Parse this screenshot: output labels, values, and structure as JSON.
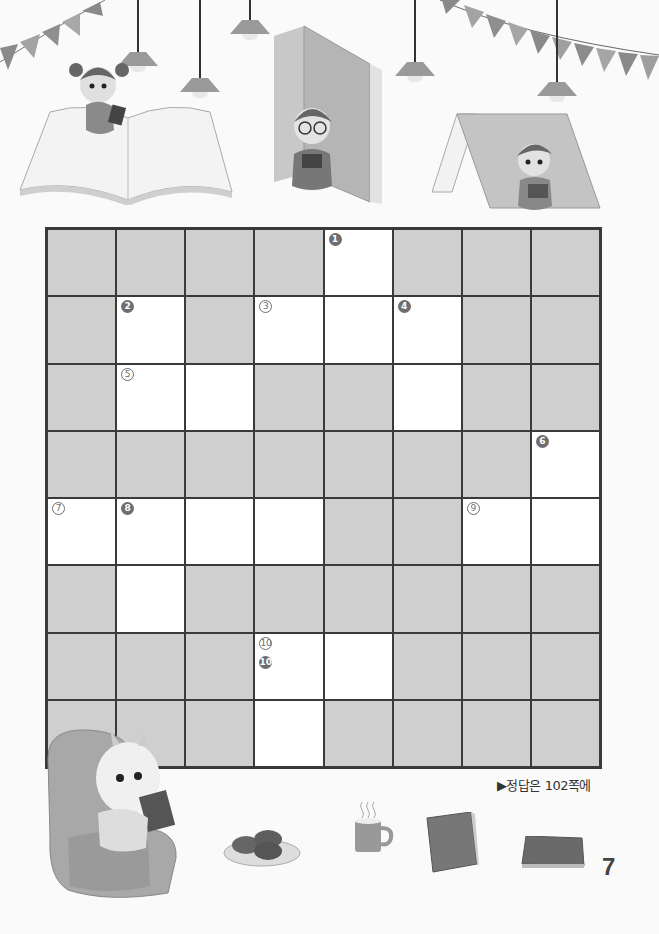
{
  "page": {
    "answer_note": "▶정답은 102쪽에",
    "page_number": "7"
  },
  "illustrations": {
    "top": [
      "bunting-left",
      "bunting-right",
      "hanging-lamps",
      "girl-reading-on-open-book",
      "boy-with-glasses-reading-behind-standing-book",
      "boy-reading-under-book-tent"
    ],
    "bottom": [
      "goat-reading-in-armchair",
      "plate-of-cookies",
      "hot-mug",
      "standing-book",
      "lying-book"
    ]
  },
  "colors": {
    "blocked_cell": "#cfcfcf",
    "open_cell": "#ffffff",
    "grid_line": "#3a3a3a",
    "badge": "#6e6e6e"
  },
  "crossword": {
    "rows": 8,
    "cols": 8,
    "legend": {
      "filled_badge": "down clue",
      "outlined_badge": "across clue"
    },
    "cells": [
      [
        {
          "w": 0
        },
        {
          "w": 0
        },
        {
          "w": 0
        },
        {
          "w": 0
        },
        {
          "w": 1,
          "down": "1"
        },
        {
          "w": 0
        },
        {
          "w": 0
        },
        {
          "w": 0
        }
      ],
      [
        {
          "w": 0
        },
        {
          "w": 1,
          "down": "2"
        },
        {
          "w": 0
        },
        {
          "w": 1,
          "across": "3"
        },
        {
          "w": 1
        },
        {
          "w": 1,
          "down": "4"
        },
        {
          "w": 0
        },
        {
          "w": 0
        }
      ],
      [
        {
          "w": 0
        },
        {
          "w": 1,
          "across": "5"
        },
        {
          "w": 1
        },
        {
          "w": 0
        },
        {
          "w": 0
        },
        {
          "w": 1
        },
        {
          "w": 0
        },
        {
          "w": 0
        }
      ],
      [
        {
          "w": 0
        },
        {
          "w": 0
        },
        {
          "w": 0
        },
        {
          "w": 0
        },
        {
          "w": 0
        },
        {
          "w": 0
        },
        {
          "w": 0
        },
        {
          "w": 1,
          "down": "6"
        }
      ],
      [
        {
          "w": 1,
          "across": "7"
        },
        {
          "w": 1,
          "down": "8"
        },
        {
          "w": 1
        },
        {
          "w": 1
        },
        {
          "w": 0
        },
        {
          "w": 0
        },
        {
          "w": 1,
          "across": "9"
        },
        {
          "w": 1
        }
      ],
      [
        {
          "w": 0
        },
        {
          "w": 1
        },
        {
          "w": 0
        },
        {
          "w": 0
        },
        {
          "w": 0
        },
        {
          "w": 0
        },
        {
          "w": 0
        },
        {
          "w": 0
        }
      ],
      [
        {
          "w": 0
        },
        {
          "w": 0
        },
        {
          "w": 0
        },
        {
          "w": 1,
          "across": "10",
          "down": "10"
        },
        {
          "w": 1
        },
        {
          "w": 0
        },
        {
          "w": 0
        },
        {
          "w": 0
        }
      ],
      [
        {
          "w": 0
        },
        {
          "w": 0
        },
        {
          "w": 0
        },
        {
          "w": 1
        },
        {
          "w": 0
        },
        {
          "w": 0
        },
        {
          "w": 0
        },
        {
          "w": 0
        }
      ]
    ]
  }
}
